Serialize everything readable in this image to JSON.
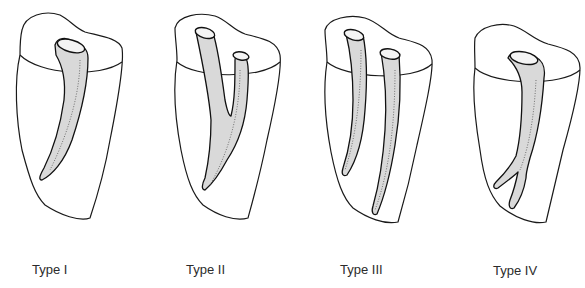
{
  "figure": {
    "panels": [
      {
        "id": "type-1",
        "label": "Type I",
        "description": "Single canal from pulp chamber to apex"
      },
      {
        "id": "type-2",
        "label": "Type II",
        "description": "Two separate canals leaving the pulp chamber, joining short of the apex into one"
      },
      {
        "id": "type-3",
        "label": "Type III",
        "description": "Two separate canals running from pulp chamber to apex"
      },
      {
        "id": "type-4",
        "label": "Type IV",
        "description": "One canal leaving the pulp chamber, dividing into two near the apex"
      }
    ]
  },
  "colors": {
    "line": "#1a1a1a",
    "canal_fill": "#d9d9d9",
    "background": "#ffffff",
    "label_text": "#2b2b2b"
  }
}
